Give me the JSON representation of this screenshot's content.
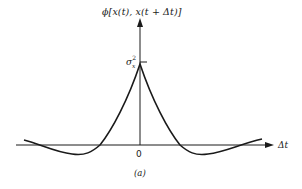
{
  "figure": {
    "y_axis_label": "ϕ[x(t), x(t + Δt)]",
    "x_axis_label": "Δt",
    "origin_label": "0",
    "peak_label_base": "σ",
    "peak_label_sup": "2",
    "peak_label_sub": "x",
    "caption": "(a)",
    "line_color": "#1a1a1a"
  }
}
